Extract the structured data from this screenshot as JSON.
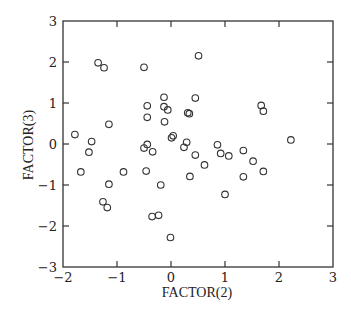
{
  "chart_data": {
    "type": "scatter",
    "title": "",
    "xlabel": "FACTOR(2)",
    "ylabel": "FACTOR(3)",
    "xlim": [
      -2,
      3
    ],
    "ylim": [
      -3,
      3
    ],
    "xticks": [
      -2,
      -1,
      0,
      1,
      2,
      3
    ],
    "yticks": [
      -3,
      -2,
      -1,
      0,
      1,
      2,
      3
    ],
    "grid": false,
    "legend": null,
    "marker": "open-circle",
    "series": [
      {
        "name": "observations",
        "points": [
          [
            -1.35,
            1.98
          ],
          [
            -1.24,
            1.86
          ],
          [
            -0.5,
            1.87
          ],
          [
            0.51,
            2.15
          ],
          [
            -1.78,
            0.23
          ],
          [
            -1.15,
            0.48
          ],
          [
            -1.47,
            0.06
          ],
          [
            -1.52,
            -0.2
          ],
          [
            -1.67,
            -0.68
          ],
          [
            -0.88,
            -0.68
          ],
          [
            -1.15,
            -0.98
          ],
          [
            -1.26,
            -1.41
          ],
          [
            -1.18,
            -1.55
          ],
          [
            -0.44,
            0.93
          ],
          [
            -0.44,
            0.65
          ],
          [
            -0.13,
            1.14
          ],
          [
            0.45,
            1.12
          ],
          [
            -0.13,
            0.91
          ],
          [
            -0.06,
            0.83
          ],
          [
            0.31,
            0.76
          ],
          [
            0.34,
            0.74
          ],
          [
            -0.12,
            0.54
          ],
          [
            0.04,
            0.2
          ],
          [
            0.01,
            0.15
          ],
          [
            -0.5,
            -0.1
          ],
          [
            -0.44,
            -0.01
          ],
          [
            -0.34,
            -0.19
          ],
          [
            0.29,
            0.04
          ],
          [
            0.24,
            -0.08
          ],
          [
            0.45,
            -0.27
          ],
          [
            0.62,
            -0.51
          ],
          [
            -0.46,
            -0.66
          ],
          [
            0.35,
            -0.79
          ],
          [
            -0.19,
            -1.0
          ],
          [
            -0.35,
            -1.77
          ],
          [
            -0.23,
            -1.74
          ],
          [
            -0.01,
            -2.28
          ],
          [
            1.67,
            0.94
          ],
          [
            1.71,
            0.8
          ],
          [
            2.22,
            0.1
          ],
          [
            0.86,
            -0.02
          ],
          [
            0.92,
            -0.23
          ],
          [
            1.07,
            -0.29
          ],
          [
            1.34,
            -0.16
          ],
          [
            1.52,
            -0.42
          ],
          [
            1.71,
            -0.67
          ],
          [
            1.34,
            -0.8
          ],
          [
            1.0,
            -1.23
          ]
        ]
      }
    ]
  },
  "labels": {
    "xlabel": "FACTOR(2)",
    "ylabel": "FACTOR(3)"
  }
}
